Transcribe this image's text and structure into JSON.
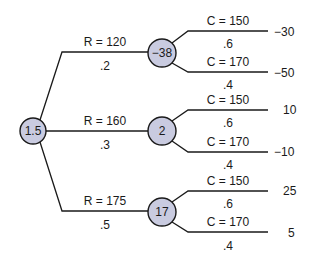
{
  "diagram": {
    "type": "decision-tree",
    "colors": {
      "node_fill": "#c9cbe0",
      "line": "#1a1a1a",
      "background": "#ffffff"
    },
    "root": {
      "value": "1.5"
    },
    "branches": [
      {
        "label": "R = 120",
        "probability": ".2",
        "node_value": "−38",
        "outcomes": [
          {
            "label": "C = 150",
            "probability": ".6",
            "payoff": "−30"
          },
          {
            "label": "C = 170",
            "probability": ".4",
            "payoff": "−50"
          }
        ]
      },
      {
        "label": "R = 160",
        "probability": ".3",
        "node_value": "2",
        "outcomes": [
          {
            "label": "C = 150",
            "probability": ".6",
            "payoff": "10"
          },
          {
            "label": "C = 170",
            "probability": ".4",
            "payoff": "−10"
          }
        ]
      },
      {
        "label": "R = 175",
        "probability": ".5",
        "node_value": "17",
        "outcomes": [
          {
            "label": "C = 150",
            "probability": ".6",
            "payoff": "25"
          },
          {
            "label": "C = 170",
            "probability": ".4",
            "payoff": "5"
          }
        ]
      }
    ]
  }
}
